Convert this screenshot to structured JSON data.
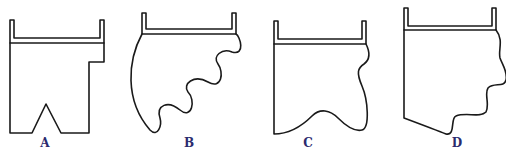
{
  "figure": {
    "line_color": "#1a1a1a",
    "label_color": "#2b2b6e",
    "shapes": [
      {
        "id": "A",
        "label": "A"
      },
      {
        "id": "B",
        "label": "B"
      },
      {
        "id": "C",
        "label": "C"
      },
      {
        "id": "D",
        "label": "D"
      }
    ]
  }
}
